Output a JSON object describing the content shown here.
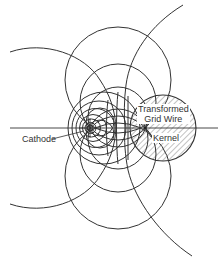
{
  "figure": {
    "labels": {
      "cathode": "Cathode",
      "transformed_grid_wire_line1": "Transformed",
      "transformed_grid_wire_line2": "Grid Wire",
      "kernel": "Kernel"
    },
    "colors": {
      "line": "#333333",
      "hatch": "#555555",
      "background": "#ffffff"
    },
    "geometry": {
      "axis_y": 128,
      "cathode_center": [
        90,
        128
      ],
      "grid_wire_center": [
        163,
        128
      ],
      "grid_wire_radius": 33,
      "kernel_point": [
        145,
        128
      ]
    }
  }
}
